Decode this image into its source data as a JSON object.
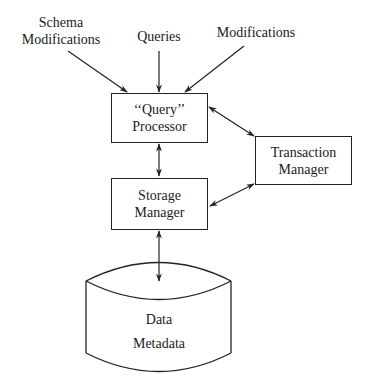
{
  "diagram": {
    "inputs": [
      {
        "id": "schema-modifications",
        "line1": "Schema",
        "line2": "Modifications"
      },
      {
        "id": "queries",
        "label": "Queries"
      },
      {
        "id": "modifications",
        "label": "Modifications"
      }
    ],
    "query_processor": {
      "line1": "‘‘Query’’",
      "line2": "Processor"
    },
    "storage_manager": {
      "line1": "Storage",
      "line2": "Manager"
    },
    "transaction_manager": {
      "line1": "Transaction",
      "line2": "Manager"
    },
    "database": {
      "line1": "Data",
      "line2": "Metadata"
    },
    "edges": [
      {
        "from": "Schema Modifications",
        "to": "Query Processor",
        "type": "one-way"
      },
      {
        "from": "Queries",
        "to": "Query Processor",
        "type": "one-way"
      },
      {
        "from": "Modifications",
        "to": "Query Processor",
        "type": "one-way"
      },
      {
        "from": "Query Processor",
        "to": "Storage Manager",
        "type": "two-way"
      },
      {
        "from": "Query Processor",
        "to": "Transaction Manager",
        "type": "two-way"
      },
      {
        "from": "Storage Manager",
        "to": "Transaction Manager",
        "type": "two-way"
      },
      {
        "from": "Storage Manager",
        "to": "Data/Metadata",
        "type": "two-way"
      }
    ],
    "colors": {
      "stroke": "#222222",
      "background": "#ffffff"
    }
  }
}
